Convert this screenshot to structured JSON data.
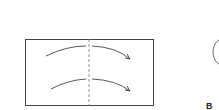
{
  "diagram": {
    "type": "paper-folding-step",
    "paper": {
      "x": 25,
      "y": 39,
      "width": 129,
      "height": 66,
      "stroke": "#444444"
    },
    "fold_line": {
      "x": 89,
      "style": "dashed",
      "stroke": "#666666"
    },
    "arrows": [
      {
        "direction": "left-to-right",
        "y_start": 56,
        "y_end": 59
      },
      {
        "direction": "left-to-right",
        "y_start": 89,
        "y_end": 91
      }
    ],
    "partial_circle": {
      "visible": true,
      "note": "cut off at right edge"
    },
    "step_label": "B"
  }
}
